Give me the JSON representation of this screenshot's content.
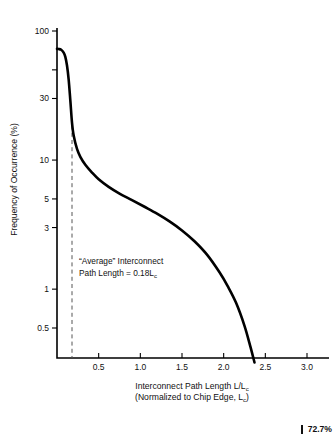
{
  "chart_data": {
    "type": "line",
    "title": "",
    "xlabel": "Interconnect Path Length L/L_c",
    "xlabel_line1": "Interconnect Path Length L/L",
    "xlabel_line1_sub": "c",
    "xlabel_line2_a": "(Normalized to Chip Edge, L",
    "xlabel_line2_sub": "c",
    "xlabel_line2_b": ")",
    "ylabel": "Frequency of Occurrence (%)",
    "yscale": "log",
    "xscale": "linear",
    "xlim": [
      0,
      3.0
    ],
    "ylim": [
      0.25,
      100
    ],
    "grid": false,
    "legend": "none",
    "xticks": [
      0.5,
      1.0,
      1.5,
      2.0,
      2.5,
      3.0
    ],
    "xticklabels": [
      "0.5",
      "1.0",
      "1.5",
      "2.0",
      "2.5",
      "3.0"
    ],
    "yticks": [
      100,
      50,
      30,
      10,
      5,
      3,
      1,
      0.5
    ],
    "yticklabels": [
      "100",
      "",
      "30",
      "10",
      "5",
      "3",
      "1",
      "0.5"
    ],
    "series": [
      {
        "name": "Interconnect path length distribution",
        "x": [
          0.0,
          0.02,
          0.05,
          0.08,
          0.1,
          0.12,
          0.14,
          0.16,
          0.18,
          0.2,
          0.24,
          0.28,
          0.34,
          0.42,
          0.5,
          0.62,
          0.75,
          0.9,
          1.05,
          1.2,
          1.35,
          1.5,
          1.65,
          1.8,
          1.95,
          2.05,
          2.15,
          2.25,
          2.32,
          2.37
        ],
        "y": [
          72.7,
          72.5,
          71.5,
          68.0,
          63.0,
          54.0,
          42.0,
          29.0,
          19.5,
          15.5,
          12.2,
          10.6,
          9.2,
          8.0,
          7.1,
          6.2,
          5.5,
          4.9,
          4.35,
          3.85,
          3.35,
          2.85,
          2.35,
          1.85,
          1.35,
          1.05,
          0.78,
          0.52,
          0.36,
          0.27
        ]
      }
    ],
    "annotations": [
      {
        "name": "average-interconnect-note",
        "line1": "“Average” Interconnect",
        "line2_a": "Path Length = 0.18L",
        "line2_sub": "c",
        "x": 0.18
      }
    ],
    "reference_lines": [
      {
        "name": "average-path-length-marker",
        "orientation": "vertical",
        "value": 0.18,
        "style": "dashed"
      }
    ],
    "peak_value_label": "72.7%"
  },
  "footnote": {
    "text": "72.7%"
  }
}
